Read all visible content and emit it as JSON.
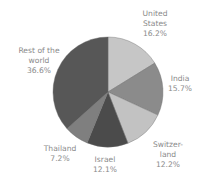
{
  "chart_data": {
    "type": "pie",
    "title": "",
    "start_angle": "12 o'clock",
    "direction": "clockwise",
    "legend": "none (direct labels)",
    "slices": [
      {
        "label": "United States",
        "label_lines": [
          "United",
          "States"
        ],
        "value": 16.2,
        "value_label": "16.2%",
        "color": "#c6c6c6"
      },
      {
        "label": "India",
        "label_lines": [
          "India"
        ],
        "value": 15.7,
        "value_label": "15.7%",
        "color": "#8b8b8b"
      },
      {
        "label": "Switzerland",
        "label_lines": [
          "Switzer-",
          "land"
        ],
        "value": 12.2,
        "value_label": "12.2%",
        "color": "#c2c2c2"
      },
      {
        "label": "Israel",
        "label_lines": [
          "Israel"
        ],
        "value": 12.1,
        "value_label": "12.1%",
        "color": "#4b4b4b"
      },
      {
        "label": "Thailand",
        "label_lines": [
          "Thailand"
        ],
        "value": 7.2,
        "value_label": "7.2%",
        "color": "#7f7f7f"
      },
      {
        "label": "Rest of the world",
        "label_lines": [
          "Rest of the",
          "world"
        ],
        "value": 36.6,
        "value_label": "36.6%",
        "color": "#575757"
      }
    ]
  },
  "labels": {
    "us": {
      "line1": "United",
      "line2": "States",
      "pct": "16.2%"
    },
    "india": {
      "line1": "India",
      "pct": "15.7%"
    },
    "switzerland": {
      "line1": "Switzer-",
      "line2": "land",
      "pct": "12.2%"
    },
    "israel": {
      "line1": "Israel",
      "pct": "12.1%"
    },
    "thailand": {
      "line1": "Thailand",
      "pct": "7.2%"
    },
    "rest": {
      "line1": "Rest of the",
      "line2": "world",
      "pct": "36.6%"
    }
  }
}
